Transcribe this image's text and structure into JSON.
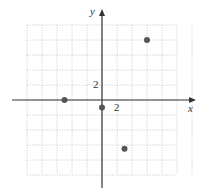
{
  "chart_data": {
    "type": "scatter",
    "title": "",
    "xlabel": "x",
    "ylabel": "y",
    "tick_labels": {
      "x": "2",
      "y": "2"
    },
    "grid_step": 2,
    "xlim": [
      -12,
      12
    ],
    "ylim": [
      -12,
      12
    ],
    "grid": true,
    "points": [
      {
        "x": 6,
        "y": 8
      },
      {
        "x": -5,
        "y": 0
      },
      {
        "x": 0,
        "y": -1
      },
      {
        "x": 3,
        "y": -6.5
      }
    ],
    "point_color": "#555555",
    "axis_color": "#333333",
    "grid_color": "#bbbbbb"
  }
}
